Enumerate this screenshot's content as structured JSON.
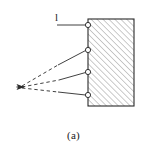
{
  "figure": {
    "caption": "(a)",
    "labels": {
      "length": "l"
    },
    "colors": {
      "stroke": "#2b2b2b",
      "hatch": "#8c8c8c",
      "background": "#ffffff",
      "node_fill": "#ffffff"
    },
    "block": {
      "shape": "rectangle",
      "fill_pattern": "diagonal-hatch-45",
      "x": 88,
      "y": 19,
      "width": 46,
      "height": 87
    },
    "apex": {
      "x": 17,
      "y": 87,
      "marker": "arrowhead-left"
    },
    "nodes": [
      {
        "id": "node-1",
        "cx": 88,
        "cy": 25,
        "r": 2.6
      },
      {
        "id": "node-2",
        "cx": 88,
        "cy": 50,
        "r": 2.6
      },
      {
        "id": "node-3",
        "cx": 88,
        "cy": 72,
        "r": 2.6
      },
      {
        "id": "node-4",
        "cx": 88,
        "cy": 95,
        "r": 2.6
      }
    ],
    "rays": [
      {
        "id": "ray-1",
        "from_node": "node-2",
        "dash_portion": 0.55,
        "style": "dashed-then-solid"
      },
      {
        "id": "ray-2",
        "from_node": "node-3",
        "dash_portion": 0.58,
        "style": "dashed-then-solid"
      },
      {
        "id": "ray-3",
        "from_node": "node-4",
        "dash_portion": 0.62,
        "style": "dashed-then-solid"
      }
    ],
    "leader_line": {
      "id": "leader-length",
      "from_x": 57,
      "from_y": 25,
      "to_x": 88,
      "to_y": 25,
      "style": "solid"
    }
  }
}
